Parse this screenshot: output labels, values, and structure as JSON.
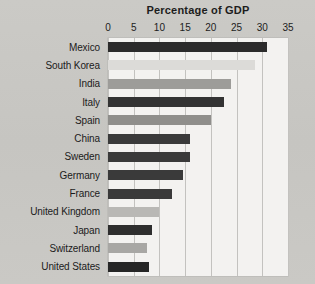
{
  "chart_data": {
    "type": "bar",
    "orientation": "horizontal",
    "title": "Percentage of GDP",
    "xlabel": "",
    "ylabel": "",
    "xlim": [
      0,
      35
    ],
    "xticks": [
      0,
      5,
      10,
      15,
      20,
      25,
      30,
      35
    ],
    "xtick_labels": [
      "0",
      "5",
      "10",
      "15",
      "20",
      "25",
      "30",
      "35"
    ],
    "grid": "vertical",
    "legend": "none",
    "categories": [
      "Mexico",
      "South Korea",
      "India",
      "Italy",
      "Spain",
      "China",
      "Sweden",
      "Germany",
      "France",
      "United Kingdom",
      "Japan",
      "Switzerland",
      "United States"
    ],
    "values": [
      31,
      28.5,
      24,
      22.5,
      20,
      16,
      16,
      14.5,
      12.5,
      10,
      8.5,
      7.5,
      8
    ],
    "bar_colors": [
      "#2b2b2b",
      "#dcdbd8",
      "#9d9c99",
      "#333333",
      "#8f8e8b",
      "#3a3a3a",
      "#3a3a3a",
      "#3a3a3a",
      "#3a3a3a",
      "#b9b8b5",
      "#2e2e2e",
      "#a8a7a4",
      "#262626"
    ]
  },
  "colors": {
    "page_background": "#c9c8c4",
    "plot_background": "#f3f2f0",
    "gridline": "#c3c2bf",
    "text": "#1d1d1d"
  }
}
